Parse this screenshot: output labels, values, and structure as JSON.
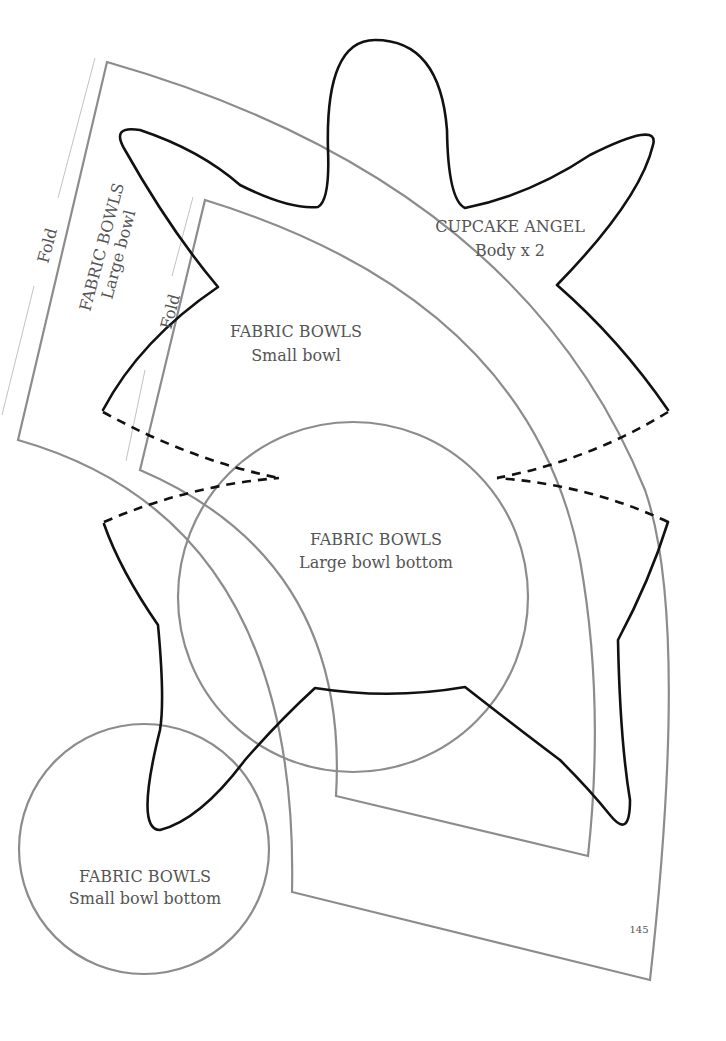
{
  "page": {
    "number": "145"
  },
  "patterns": {
    "cupcake_angel": {
      "title": "CUPCAKE ANGEL",
      "subtitle": "Body x 2"
    },
    "large_bowl": {
      "title": "FABRIC BOWLS",
      "subtitle": "Large bowl",
      "fold_label": "Fold"
    },
    "small_bowl": {
      "title": "FABRIC BOWLS",
      "subtitle": "Small bowl",
      "fold_label": "Fold"
    },
    "large_bowl_bottom": {
      "title": "FABRIC BOWLS",
      "subtitle": "Large bowl bottom"
    },
    "small_bowl_bottom": {
      "title": "FABRIC BOWLS",
      "subtitle": "Small bowl bottom"
    }
  },
  "colors": {
    "outline_black": "#111111",
    "outline_gray": "#8c8c8c",
    "text": "#555555",
    "fold_line": "#bbbbbb"
  }
}
